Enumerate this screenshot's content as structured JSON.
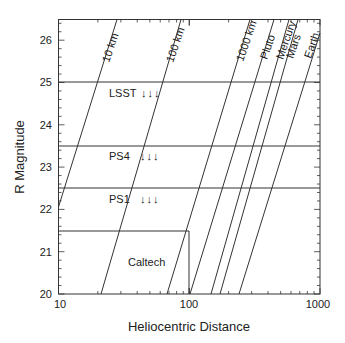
{
  "chart_data": {
    "type": "line",
    "title": "",
    "xlabel": "Heliocentric Distance",
    "ylabel": "R Magnitude",
    "xscale": "log",
    "xlim": [
      10,
      1000
    ],
    "ylim": [
      20,
      26.5
    ],
    "x_tick_labels": [
      "10",
      "100",
      "1000"
    ],
    "y_tick_labels": [
      "20",
      "21",
      "22",
      "23",
      "24",
      "25",
      "26"
    ],
    "grid": false,
    "series": [
      {
        "name": "10 km",
        "points": [
          [
            10,
            22.05
          ],
          [
            27.9,
            26.5
          ]
        ]
      },
      {
        "name": "100 km",
        "points": [
          [
            21,
            20
          ],
          [
            86,
            26.5
          ]
        ]
      },
      {
        "name": "1000 km",
        "points": [
          [
            68,
            20
          ],
          [
            285,
            26.5
          ]
        ]
      },
      {
        "name": "Pluto",
        "points": [
          [
            101,
            20
          ],
          [
            430,
            26.5
          ]
        ]
      },
      {
        "name": "Mercury",
        "points": [
          [
            146,
            20
          ],
          [
            620,
            26.5
          ]
        ]
      },
      {
        "name": "Mars",
        "points": [
          [
            172,
            20
          ],
          [
            730,
            26.5
          ]
        ]
      },
      {
        "name": "Earth",
        "points": [
          [
            240,
            20
          ],
          [
            1000,
            26.2
          ]
        ]
      }
    ],
    "survey_limits": [
      {
        "name": "LSST",
        "magnitude": 25.0
      },
      {
        "name": "PS4",
        "magnitude": 23.5
      },
      {
        "name": "PS1",
        "magnitude": 22.5
      }
    ],
    "region": {
      "name": "Caltech",
      "x_range": [
        10,
        100
      ],
      "y_range": [
        20,
        21.5
      ]
    }
  },
  "labels": {
    "xlabel": "Heliocentric Distance",
    "ylabel": "R Magnitude",
    "x_ticks": [
      "10",
      "100",
      "1000"
    ],
    "y_ticks": [
      "20",
      "21",
      "22",
      "23",
      "24",
      "25",
      "26"
    ],
    "lines": [
      "10 km",
      "100 km",
      "1000 km",
      "Pluto",
      "Mercury",
      "Mars",
      "Earth"
    ],
    "surveys": [
      "LSST",
      "PS4",
      "PS1"
    ],
    "region": "Caltech",
    "arrows": "↓↓↓"
  }
}
